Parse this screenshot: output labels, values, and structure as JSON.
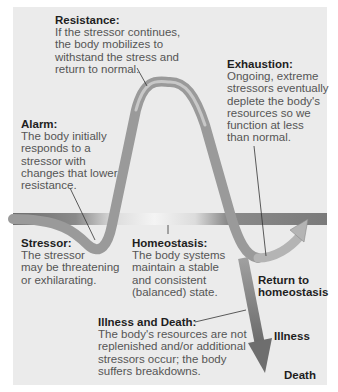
{
  "diagram": {
    "colors": {
      "background": "#ebebeb",
      "curve": "#9a9a9a",
      "curve_highlight": "#c4c4c4",
      "band_dark": "#7d7d7d",
      "band_light": "#e6e6e6",
      "title_text": "#1e1e1e",
      "body_text": "#555555"
    },
    "resistance": {
      "title": "Resistance:",
      "text": "If the stressor continues,\nthe body mobilizes to\nwithstand the stress and\nreturn to normal."
    },
    "exhaustion": {
      "title": "Exhaustion:",
      "text": "Ongoing, extreme\nstressors eventually\ndeplete the body's\nresources so we\nfunction at less\nthan normal."
    },
    "alarm": {
      "title": "Alarm:",
      "text": "The body initially\nresponds to a\nstressor with\nchanges that lower\nresistance."
    },
    "stressor": {
      "title": "Stressor:",
      "text": "The stressor\nmay be threatening\nor exhilarating."
    },
    "homeostasis": {
      "title": "Homeostasis:",
      "text": "The body systems\nmaintain a stable\nand consistent\n(balanced) state."
    },
    "illness_and_death": {
      "title": "Illness and Death:",
      "text": "The body's resources are not\nreplenished and/or additional\nstressors occur; the body\nsuffers breakdowns."
    },
    "outcomes": {
      "return": "Return to\nhomeostasis",
      "illness": "Illness",
      "death": "Death"
    }
  }
}
